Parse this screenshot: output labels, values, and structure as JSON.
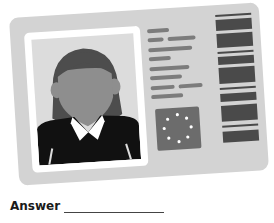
{
  "illustration": {
    "subject": "id-card",
    "colors": {
      "card": "#d3d3d3",
      "frame": "#ffffff",
      "photo_bg": "#dcdcdc",
      "hair": "#4d4d4d",
      "face": "#8e8e8e",
      "jacket": "#111111",
      "text_lines": "#7c7c7c",
      "flag": "#6c6c6c",
      "barcode": "#4a4a4a"
    },
    "flag_stars": 8
  },
  "answer": {
    "label": "Answer"
  }
}
